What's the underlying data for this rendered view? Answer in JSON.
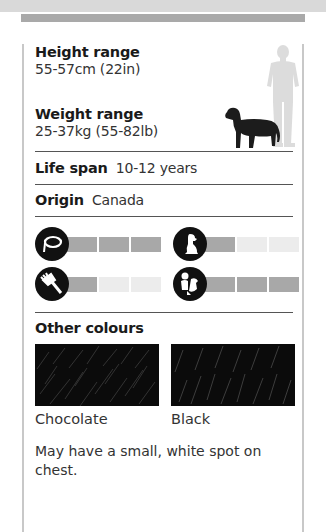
{
  "height": {
    "label": "Height range",
    "value": "55-57cm (22in)"
  },
  "weight": {
    "label": "Weight range",
    "value": "25-37kg (55-82lb)"
  },
  "life_span": {
    "label": "Life span",
    "value": "10-12 years"
  },
  "origin": {
    "label": "Origin",
    "value": "Canada"
  },
  "ratings": [
    {
      "icon": "leash-icon",
      "filled": 3,
      "total": 3
    },
    {
      "icon": "sitting-dog-icon",
      "filled": 1,
      "total": 3
    },
    {
      "icon": "comb-icon",
      "filled": 1,
      "total": 3
    },
    {
      "icon": "child-with-dog-icon",
      "filled": 3,
      "total": 3
    }
  ],
  "other_colours": {
    "title": "Other colours",
    "swatches": [
      {
        "label": "Chocolate",
        "color": "#0b0b0b"
      },
      {
        "label": "Black",
        "color": "#0b0b0b"
      }
    ]
  },
  "note": "May have a small, white spot on chest.",
  "colors": {
    "bar_on": "#a8a8a8",
    "bar_off": "#ececec",
    "border": "#c8c8c8"
  }
}
